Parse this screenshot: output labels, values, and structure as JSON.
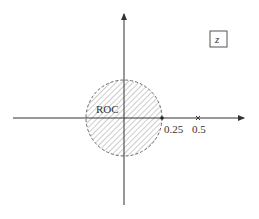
{
  "diagram": {
    "type": "z-plane pole-zero plot",
    "plane_label": "z",
    "roc_label": "ROC",
    "roc": {
      "shape": "disk",
      "radius": 0.25,
      "boundary": "dashed",
      "fill": "hatched"
    },
    "markers": [
      {
        "value": 0.25,
        "label": "0.25",
        "kind": "dot"
      },
      {
        "value": 0.5,
        "label": "0.5",
        "kind": "cross"
      }
    ],
    "colors": {
      "axis": "#333333",
      "hatch": "#9a9a9a",
      "boundary": "#666666"
    }
  }
}
